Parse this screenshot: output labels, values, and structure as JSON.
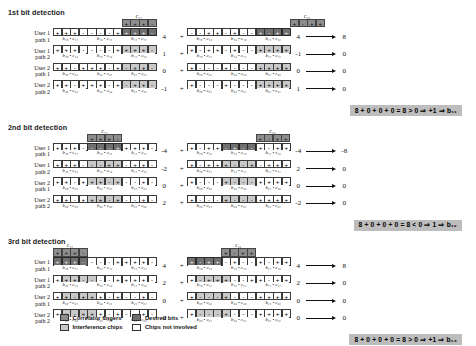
{
  "legend": {
    "items": [
      {
        "label": "Correlator fingers",
        "swatch": "finger"
      },
      {
        "label": "Desired bits",
        "swatch": "dark"
      },
      {
        "label": "Interference chips",
        "swatch": "light"
      },
      {
        "label": "Chips not involved",
        "swatch": "white"
      }
    ]
  },
  "row_labels": [
    "User 1\npath 1",
    "User 1\npath 2",
    "User 2\npath 1",
    "User 2\npath 2"
  ],
  "plus_sign": "+",
  "sections": [
    {
      "title": "1st bit detection",
      "finger_label": "c₁₁",
      "left": {
        "finger_offset": 8,
        "finger_chips": [
          "+",
          "+",
          "+",
          "-"
        ],
        "rows": [
          {
            "chips": [
              "+",
              "+",
              "+",
              "-",
              "-",
              "-",
              "-",
              "+",
              "+",
              "+",
              "+",
              "-"
            ],
            "shade": [
              "w",
              "w",
              "w",
              "w",
              "w",
              "w",
              "w",
              "w",
              "d",
              "d",
              "d",
              "d"
            ],
            "value": "4",
            "braces": [
              "b₁₃ • c₁₁",
              "b₁₂ • c₁₁",
              "b₁₁ • c₁₁"
            ]
          },
          {
            "chips": [
              "+",
              "+",
              "+",
              "-",
              "-",
              "-",
              "-",
              "+",
              "+",
              "+",
              "+",
              "-"
            ],
            "shade": [
              "w",
              "w",
              "w",
              "w",
              "w",
              "w",
              "w",
              "w",
              "l",
              "l",
              "l",
              "l"
            ],
            "value": "1",
            "braces": [
              "b₁₃ • c₁₂",
              "b₁₂ • c₁₂",
              "b₁₁ • c₁₂"
            ]
          },
          {
            "chips": [
              "+",
              "+",
              "-",
              "+",
              "+",
              "+",
              "-",
              "+",
              "-",
              "+",
              "+",
              "-"
            ],
            "shade": [
              "w",
              "w",
              "w",
              "w",
              "w",
              "w",
              "w",
              "w",
              "l",
              "l",
              "l",
              "l"
            ],
            "value": "0",
            "braces": [
              "b₂₃ • c₂₁",
              "b₂₂ • c₂₁",
              "b₂₁ • c₂₁"
            ]
          },
          {
            "chips": [
              "+",
              "+",
              "-",
              "+",
              "+",
              "+",
              "-",
              "+",
              "-",
              "+",
              "+",
              "-"
            ],
            "shade": [
              "w",
              "w",
              "w",
              "w",
              "w",
              "w",
              "w",
              "w",
              "l",
              "l",
              "l",
              "l"
            ],
            "value": "-1",
            "braces": [
              "b₂₃ • c₂₂",
              "b₂₂ • c₂₂",
              "b₂₁ • c₂₂"
            ]
          }
        ]
      },
      "right": {
        "finger_label": "c₁₂",
        "finger_offset": 8,
        "finger_chips": [
          "+",
          "-",
          "+",
          "+"
        ],
        "rows": [
          {
            "chips": [
              "-",
              "-",
              "+",
              "+",
              "-",
              "+",
              "-",
              "-",
              "+",
              "-",
              "+",
              "+"
            ],
            "shade": [
              "w",
              "w",
              "w",
              "w",
              "w",
              "w",
              "w",
              "w",
              "d",
              "d",
              "d",
              "d"
            ],
            "value": "4",
            "out": "8",
            "braces": [
              "b₁₃ • c₁₂",
              "b₁₂ • c₁₂",
              "b₁₁ • c₁₂"
            ]
          },
          {
            "chips": [
              "+",
              "-",
              "+",
              "+",
              "-",
              "+",
              "-",
              "-",
              "+",
              "+",
              "+",
              "+"
            ],
            "shade": [
              "w",
              "w",
              "w",
              "w",
              "w",
              "w",
              "w",
              "w",
              "l",
              "l",
              "l",
              "l"
            ],
            "value": "-1",
            "out": "0",
            "braces": [
              "b₁₃ • c₁₁",
              "b₁₂ • c₁₁",
              "b₁₁ • c₁₁"
            ]
          },
          {
            "chips": [
              "+",
              "-",
              "-",
              "-",
              "+",
              "-",
              "-",
              "-",
              "+",
              "+",
              "+",
              "+"
            ],
            "shade": [
              "w",
              "w",
              "w",
              "w",
              "w",
              "w",
              "w",
              "w",
              "l",
              "l",
              "l",
              "l"
            ],
            "value": "0",
            "out": "0",
            "braces": [
              "b₂₃ • c₂₂",
              "b₂₂ • c₂₂",
              "b₂₁ • c₂₂"
            ]
          },
          {
            "chips": [
              "+",
              "-",
              "-",
              "-",
              "+",
              "-",
              "-",
              "-",
              "+",
              "+",
              "+",
              "+"
            ],
            "shade": [
              "w",
              "w",
              "w",
              "w",
              "w",
              "w",
              "w",
              "w",
              "l",
              "l",
              "l",
              "l"
            ],
            "value": "1",
            "out": "0",
            "braces": [
              "b₂₃ • c₂₁",
              "b₂₂ • c₂₁",
              "b₂₁ • c₂₁"
            ]
          }
        ]
      },
      "result": "8 + 0 + 0 + 0 = 8 > 0    ⇒ +1    ⇒ b₁₁"
    },
    {
      "title": "2nd bit detection",
      "finger_label": "c₁₁",
      "left": {
        "finger_offset": 4,
        "finger_chips": [
          "+",
          "+",
          "+",
          "-"
        ],
        "rows": [
          {
            "chips": [
              "+",
              "+",
              "+",
              "-",
              "-",
              "-",
              "-",
              "+",
              "+",
              "+",
              "+",
              "-"
            ],
            "shade": [
              "w",
              "w",
              "w",
              "w",
              "d",
              "d",
              "d",
              "d",
              "w",
              "w",
              "w",
              "w"
            ],
            "value": "-4",
            "braces": [
              "b₁₃ • c₁₁",
              "b₁₂ • c₁₁",
              "b₁₁ • c₁₁"
            ]
          },
          {
            "chips": [
              "+",
              "+",
              "+",
              "-",
              "-",
              "-",
              "+",
              "+",
              "-",
              "+",
              "+",
              "-"
            ],
            "shade": [
              "w",
              "w",
              "w",
              "w",
              "l",
              "l",
              "l",
              "l",
              "w",
              "w",
              "w",
              "w"
            ],
            "value": "-2",
            "braces": [
              "b₁₃ • c₁₂",
              "b₁₂ • c₁₂",
              "b₁₁ • c₁₂"
            ]
          },
          {
            "chips": [
              "+",
              "+",
              "-",
              "+",
              "+",
              "+",
              "-",
              "+",
              "-",
              "-",
              "+",
              "-"
            ],
            "shade": [
              "w",
              "w",
              "w",
              "w",
              "l",
              "l",
              "l",
              "l",
              "w",
              "w",
              "w",
              "w"
            ],
            "value": "0",
            "braces": [
              "b₂₃ • c₂₁",
              "b₂₂ • c₂₁",
              "b₂₁ • c₂₁"
            ]
          },
          {
            "chips": [
              "+",
              "+",
              "-",
              "+",
              "+",
              "+",
              "-",
              "+",
              "-",
              "-",
              "+",
              "-"
            ],
            "shade": [
              "w",
              "w",
              "w",
              "w",
              "l",
              "l",
              "l",
              "l",
              "w",
              "w",
              "w",
              "w"
            ],
            "value": "2",
            "braces": [
              "b₂₃ • c₂₂",
              "b₂₂ • c₂₂",
              "b₂₁ • c₂₂"
            ]
          }
        ]
      },
      "right": {
        "finger_label": "c₁₂",
        "finger_offset": 4,
        "finger_chips": [
          "+",
          "-",
          "+",
          "+"
        ],
        "rows": [
          {
            "chips": [
              "+",
              "-",
              "+",
              "+",
              "-",
              "+",
              "-",
              "-",
              "+",
              "-",
              "+",
              "+"
            ],
            "shade": [
              "w",
              "w",
              "w",
              "w",
              "d",
              "d",
              "d",
              "d",
              "w",
              "w",
              "w",
              "w"
            ],
            "value": "-4",
            "out": "-8",
            "braces": [
              "b₁₃ • c₁₂",
              "b₁₂ • c₁₂",
              "b₁₁ • c₁₂"
            ]
          },
          {
            "chips": [
              "+",
              "-",
              "+",
              "+",
              "+",
              "-",
              "-",
              "+",
              "-",
              "+",
              "+",
              "+"
            ],
            "shade": [
              "w",
              "w",
              "w",
              "w",
              "l",
              "l",
              "l",
              "l",
              "w",
              "w",
              "w",
              "w"
            ],
            "value": "2",
            "out": "0",
            "braces": [
              "b₁₃ • c₁₁",
              "b₁₂ • c₁₁",
              "b₁₁ • c₁₁"
            ]
          },
          {
            "chips": [
              "+",
              "-",
              "-",
              "-",
              "+",
              "-",
              "-",
              "-",
              "+",
              "+",
              "+",
              "+"
            ],
            "shade": [
              "w",
              "w",
              "w",
              "w",
              "l",
              "l",
              "l",
              "l",
              "w",
              "w",
              "w",
              "w"
            ],
            "value": "0",
            "out": "0",
            "braces": [
              "b₂₃ • c₂₂",
              "b₂₂ • c₂₂",
              "b₂₁ • c₂₂"
            ]
          },
          {
            "chips": [
              "+",
              "-",
              "-",
              "-",
              "+",
              "-",
              "-",
              "-",
              "+",
              "+",
              "+",
              "+"
            ],
            "shade": [
              "w",
              "w",
              "w",
              "w",
              "l",
              "l",
              "l",
              "l",
              "w",
              "w",
              "w",
              "w"
            ],
            "value": "-2",
            "out": "0",
            "braces": [
              "b₂₃ • c₂₁",
              "b₂₂ • c₂₁",
              "b₂₁ • c₂₁"
            ]
          }
        ]
      },
      "result": "8 + 0 + 0 + 0 =   8 < 0   ⇒  1   ⇒ b₁₂"
    },
    {
      "title": "3rd bit detection",
      "finger_label": "c₁₁",
      "left": {
        "finger_offset": 0,
        "finger_chips": [
          "+",
          "+",
          "+",
          "-"
        ],
        "rows": [
          {
            "chips": [
              "+",
              "+",
              "+",
              "-",
              "-",
              "-",
              "-",
              "+",
              "+",
              "+",
              "+",
              "-"
            ],
            "shade": [
              "d",
              "d",
              "d",
              "d",
              "w",
              "w",
              "w",
              "w",
              "w",
              "w",
              "w",
              "w"
            ],
            "value": "4",
            "braces": [
              "b₁₃ • c₁₁",
              "b₁₂ • c₁₁",
              "b₁₁ • c₁₁"
            ]
          },
          {
            "chips": [
              "+",
              "+",
              "+",
              "-",
              "-",
              "-",
              "-",
              "+",
              "+",
              "+",
              "+",
              "-"
            ],
            "shade": [
              "w",
              "l",
              "l",
              "l",
              "l",
              "w",
              "w",
              "w",
              "w",
              "w",
              "w",
              "w"
            ],
            "value": "2",
            "braces": [
              "b₁₃ • c₁₂",
              "b₁₂ • c₁₂",
              "b₁₁ • c₁₂"
            ]
          },
          {
            "chips": [
              "+",
              "+",
              "-",
              "+",
              "+",
              "+",
              "-",
              "+",
              "-",
              "-",
              "+",
              "-"
            ],
            "shade": [
              "w",
              "l",
              "l",
              "l",
              "l",
              "w",
              "w",
              "w",
              "w",
              "w",
              "w",
              "w"
            ],
            "value": "0",
            "braces": [
              "b₂₃ • c₂₁",
              "b₂₂ • c₂₁",
              "b₂₁ • c₂₁"
            ]
          },
          {
            "chips": [
              "+",
              "+",
              "-",
              "+",
              "+",
              "+",
              "-",
              "+",
              "-",
              "-",
              "+",
              "-"
            ],
            "shade": [
              "w",
              "l",
              "l",
              "l",
              "l",
              "w",
              "w",
              "w",
              "w",
              "w",
              "w",
              "w"
            ],
            "value": "0",
            "braces": [
              "b₂₃ • c₂₂",
              "b₂₂ • c₂₂",
              "b₂₁ • c₂₂"
            ]
          }
        ]
      },
      "right": {
        "finger_label": "c₁₂",
        "finger_offset": 0,
        "finger_chips": [
          "+",
          "-",
          "+",
          "+"
        ],
        "rows": [
          {
            "chips": [
              "+",
              "-",
              "+",
              "+",
              "-",
              "+",
              "-",
              "-",
              "+",
              "-",
              "+",
              "+"
            ],
            "shade": [
              "d",
              "d",
              "d",
              "d",
              "w",
              "w",
              "w",
              "w",
              "w",
              "w",
              "w",
              "w"
            ],
            "value": "4",
            "out": "8",
            "braces": [
              "b₁₃ • c₁₂",
              "b₁₂ • c₁₂",
              "b₁₁ • c₁₂"
            ]
          },
          {
            "chips": [
              "+",
              "-",
              "+",
              "+",
              "+",
              "-",
              "-",
              "+",
              "+",
              "-",
              "+",
              "+"
            ],
            "shade": [
              "w",
              "l",
              "l",
              "l",
              "l",
              "w",
              "w",
              "w",
              "w",
              "w",
              "w",
              "w"
            ],
            "value": "2",
            "out": "0",
            "braces": [
              "b₁₃ • c₁₁",
              "b₁₂ • c₁₁",
              "b₁₁ • c₁₁"
            ]
          },
          {
            "chips": [
              "+",
              "-",
              "-",
              "-",
              "+",
              "-",
              "-",
              "-",
              "+",
              "+",
              "+",
              "+"
            ],
            "shade": [
              "w",
              "l",
              "l",
              "l",
              "l",
              "w",
              "w",
              "w",
              "w",
              "w",
              "w",
              "w"
            ],
            "value": "0",
            "out": "0",
            "braces": [
              "b₂₃ • c₂₂",
              "b₂₂ • c₂₂",
              "b₂₁ • c₂₂"
            ]
          },
          {
            "chips": [
              "+",
              "-",
              "-",
              "-",
              "+",
              "-",
              "-",
              "-",
              "+",
              "+",
              "+",
              "+"
            ],
            "shade": [
              "w",
              "l",
              "l",
              "l",
              "l",
              "w",
              "w",
              "w",
              "w",
              "w",
              "w",
              "w"
            ],
            "value": "0",
            "out": "0",
            "braces": [
              "b₂₃ • c₂₁",
              "b₂₂ • c₂₁",
              "b₂₁ • c₂₁"
            ]
          }
        ]
      },
      "result": "8 + 0 + 0 + 0 = 8 > 0    ⇒ +1   ⇒ b₁₃"
    }
  ]
}
